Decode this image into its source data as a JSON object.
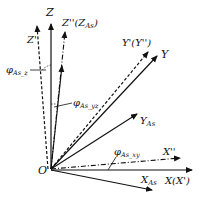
{
  "diagram": {
    "origin_label": "O",
    "axes": {
      "Z": "Z",
      "Z_prime": "Z'",
      "Z_double_prime": "Z''(Z",
      "Z_double_prime_sub": "As",
      "Z_double_prime_close": ")",
      "Y": "Y",
      "Y_prime": "Y'(Y'')",
      "Y_As": "Y",
      "Y_As_sub": "As",
      "X": "X(X')",
      "X_double_prime": "X''",
      "X_As": "X",
      "X_As_sub": "As"
    },
    "angles": {
      "phi_z": "φ",
      "phi_z_sub": "As_z",
      "phi_yz": "φ",
      "phi_yz_sub": "As_yz",
      "phi_xy": "φ",
      "phi_xy_sub": "As_xy"
    }
  }
}
